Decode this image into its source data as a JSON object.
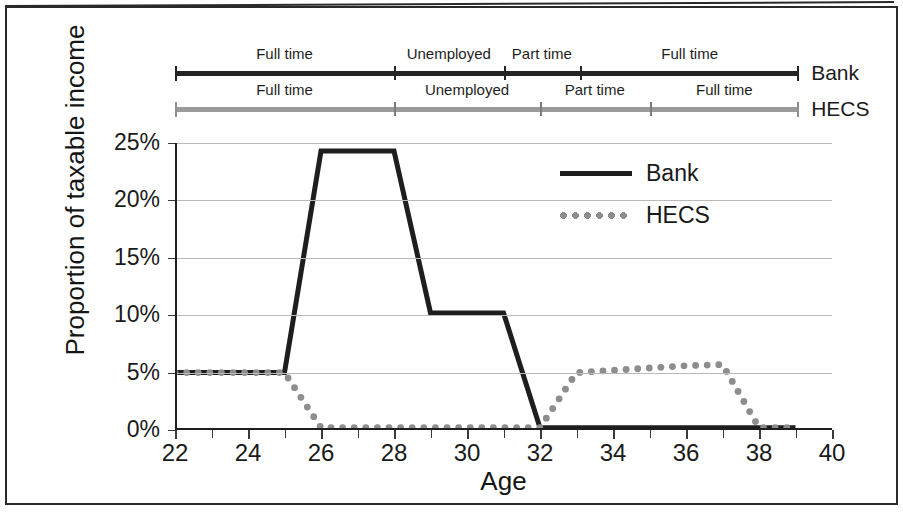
{
  "chart_data": {
    "type": "line",
    "title": "",
    "xlabel": "Age",
    "ylabel": "Proportion of taxable income",
    "xlim": [
      22,
      40
    ],
    "ylim": [
      0,
      25
    ],
    "grid": true,
    "legend_position": "inside-upper-right",
    "x_ticks": [
      22,
      24,
      26,
      28,
      30,
      32,
      34,
      36,
      38,
      40
    ],
    "x_tick_labels": [
      "22",
      "24",
      "26",
      "28",
      "30",
      "32",
      "34",
      "36",
      "38",
      "40"
    ],
    "x_minor_ticks": [
      23,
      25,
      27,
      29,
      31,
      33,
      35,
      37,
      39
    ],
    "y_ticks": [
      0,
      5,
      10,
      15,
      20,
      25
    ],
    "y_tick_labels": [
      "0%",
      "5%",
      "10%",
      "15%",
      "20%",
      "25%"
    ],
    "series": [
      {
        "name": "Bank",
        "style": "solid",
        "color": "#1e1e1e",
        "x": [
          22,
          23,
          24,
          25,
          26,
          27,
          28,
          29,
          30,
          31,
          32,
          33,
          34,
          35,
          36,
          37,
          38,
          39
        ],
        "values": [
          5.0,
          5.0,
          5.0,
          5.0,
          24.3,
          24.3,
          24.3,
          10.2,
          10.2,
          10.2,
          0.2,
          0.2,
          0.2,
          0.2,
          0.2,
          0.2,
          0.2,
          0.2
        ]
      },
      {
        "name": "HECS",
        "style": "dotted",
        "color": "#8d8d8d",
        "x": [
          22,
          23,
          24,
          25,
          26,
          27,
          28,
          29,
          30,
          31,
          32,
          33,
          34,
          35,
          36,
          37,
          38,
          39
        ],
        "values": [
          5.0,
          5.0,
          5.0,
          5.0,
          0.2,
          0.2,
          0.2,
          0.2,
          0.2,
          0.2,
          0.2,
          5.0,
          5.2,
          5.4,
          5.6,
          5.7,
          0.2,
          0.2
        ]
      }
    ],
    "annotations": {
      "timelines": [
        {
          "series": "Bank",
          "label": "Bank",
          "color": "#242424",
          "start_age": 22,
          "end_age": 39.1,
          "segments": [
            {
              "label": "Full time",
              "start_age": 22,
              "end_age": 28.0
            },
            {
              "label": "Unemployed",
              "start_age": 28.0,
              "end_age": 31.0
            },
            {
              "label": "Part time",
              "start_age": 31.0,
              "end_age": 33.1
            },
            {
              "label": "Full time",
              "start_age": 33.1,
              "end_age": 39.1
            }
          ]
        },
        {
          "series": "HECS",
          "label": "HECS",
          "color": "#9a9a9a",
          "start_age": 22,
          "end_age": 39.1,
          "segments": [
            {
              "label": "Full time",
              "start_age": 22,
              "end_age": 28.0
            },
            {
              "label": "Unemployed",
              "start_age": 28.0,
              "end_age": 32.0
            },
            {
              "label": "Part time",
              "start_age": 32.0,
              "end_age": 35.0
            },
            {
              "label": "Full time",
              "start_age": 35.0,
              "end_age": 39.1
            }
          ]
        }
      ]
    }
  },
  "legend": {
    "items": [
      {
        "label": "Bank",
        "style": "solid"
      },
      {
        "label": "HECS",
        "style": "dotted"
      }
    ]
  },
  "axes": {
    "x_title": "Age",
    "y_title": "Proportion of taxable income"
  }
}
